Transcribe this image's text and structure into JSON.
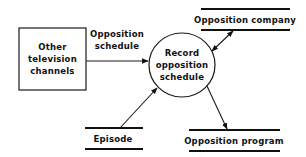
{
  "diagram": {
    "type": "data-flow-diagram",
    "external_entity": {
      "label_lines": [
        "Other",
        "television",
        "channels"
      ]
    },
    "process": {
      "label_lines": [
        "Record",
        "opposition",
        "schedule"
      ]
    },
    "data_stores": {
      "opposition_company": {
        "label": "Opposition company"
      },
      "episode": {
        "label": "Episode"
      },
      "opposition_program": {
        "label": "Opposition program"
      }
    },
    "flows": [
      {
        "from": "Other television channels",
        "to": "Record opposition schedule",
        "label_lines": [
          "Opposition",
          "schedule"
        ],
        "direction": "to-process"
      },
      {
        "from": "Record opposition schedule",
        "to": "Opposition company",
        "label_lines": [],
        "direction": "bidirectional"
      },
      {
        "from": "Episode",
        "to": "Record opposition schedule",
        "label_lines": [],
        "direction": "to-process"
      },
      {
        "from": "Record opposition schedule",
        "to": "Opposition program",
        "label_lines": [],
        "direction": "to-store"
      }
    ]
  }
}
